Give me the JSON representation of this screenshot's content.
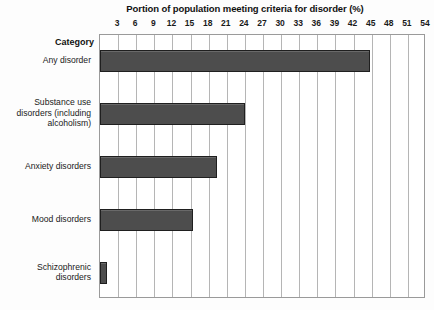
{
  "chart_data": {
    "type": "bar",
    "orientation": "horizontal",
    "title": "Portion of population meeting criteria for disorder (%)",
    "xlabel": "Portion of population meeting criteria for disorder (%)",
    "ylabel": "Category",
    "categories": [
      "Any disorder",
      "Substance use disorders (including alcoholism)",
      "Anxiety disorders",
      "Mood disorders",
      "Schizophrenic disorders"
    ],
    "values": [
      44.7,
      24.0,
      19.4,
      15.4,
      1.1
    ],
    "xlim": [
      0,
      54
    ],
    "xticks": [
      3,
      6,
      9,
      12,
      15,
      18,
      21,
      24,
      27,
      30,
      33,
      36,
      39,
      42,
      45,
      48,
      51,
      54
    ],
    "xtick_labels": [
      "3",
      "6",
      "9",
      "12",
      "15",
      "18",
      "21",
      "24",
      "27",
      "30",
      "33",
      "36",
      "39",
      "42",
      "45",
      "48",
      "51",
      "54"
    ],
    "grid": true,
    "grid_axis": "x",
    "legend": false,
    "bar_color": "#4d4d4d",
    "bar_border_color": "#1f1f1f",
    "plot_background": "#ffffff",
    "gridline_color": "#b5b5b5",
    "axis_border_color": "#9a9a9a"
  },
  "category_axis": {
    "header": "Category"
  },
  "category_label_lines": [
    [
      "Any disorder"
    ],
    [
      "Substance use",
      "disorders (including",
      "alcoholism)"
    ],
    [
      "Anxiety disorders"
    ],
    [
      "Mood disorders"
    ],
    [
      "Schizophrenic",
      "disorders"
    ]
  ]
}
